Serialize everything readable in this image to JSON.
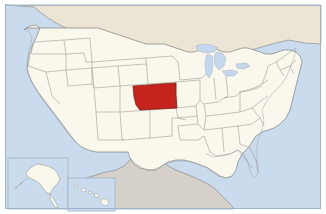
{
  "map": {
    "title": "Map of the United States with Kansas highlighted",
    "region": "United States of America",
    "highlighted_state": "Kansas",
    "projection": "Albers equal-area conic",
    "frame_label": "map-frame",
    "colors": {
      "ocean": "#cadbee",
      "ocean_deep": "#bed2e8",
      "us_land": "#faf7ec",
      "canada": "#ece4d4",
      "mexico": "#d6d0cb",
      "highlight": "#c4241b",
      "highlight_outline": "#7a1510",
      "state_border": "#8c8c86",
      "country_border": "#6e6e68",
      "coastline": "#9aa3ad",
      "frame": "#9fb4c9",
      "lake": "#c3d8ef",
      "background": "#ffffff"
    },
    "insets": [
      {
        "name": "alaska-inset",
        "label": "Alaska"
      },
      {
        "name": "hawaii-inset",
        "label": "Hawaii"
      }
    ],
    "features": [
      {
        "name": "highlighted-state-kansas",
        "label": "Kansas",
        "fill": "#c4241b"
      },
      {
        "name": "great-lakes",
        "label": "Great Lakes"
      },
      {
        "name": "gulf-of-mexico",
        "label": "Gulf of Mexico"
      },
      {
        "name": "pacific-ocean",
        "label": "Pacific Ocean"
      },
      {
        "name": "atlantic-ocean",
        "label": "Atlantic Ocean"
      }
    ]
  }
}
